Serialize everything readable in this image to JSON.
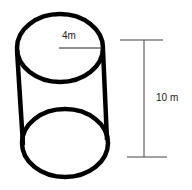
{
  "diagram": {
    "shape": "cylinder",
    "radius_label": "4m",
    "height_label": "10 m",
    "stroke_color": "#000000",
    "dimension_color": "#333333"
  }
}
